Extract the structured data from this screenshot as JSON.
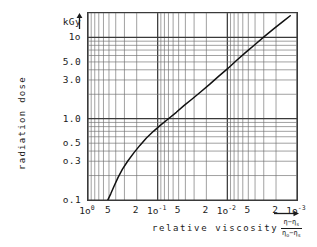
{
  "chart_data": {
    "type": "line",
    "title": "",
    "xlabel": "relative viscosity",
    "xlabel_formula": {
      "numerator": "η − η",
      "numerator_sub": "s",
      "denominator": "η",
      "denominator_sub1": "o",
      "denominator_sub2": "s"
    },
    "ylabel": "radiation dose",
    "yunit": "kGy",
    "xscale": "log",
    "yscale": "log",
    "x_direction": "decreasing",
    "xlim": [
      1.0,
      0.001
    ],
    "ylim": [
      0.1,
      20
    ],
    "grid": true,
    "legend": "none",
    "xticks": [
      {
        "value": 1.0,
        "label": "1o",
        "sup": "0"
      },
      {
        "value": 0.5,
        "label": "5",
        "sup": ""
      },
      {
        "value": 0.2,
        "label": "2",
        "sup": ""
      },
      {
        "value": 0.1,
        "label": "1o",
        "sup": "-1"
      },
      {
        "value": 0.05,
        "label": "5",
        "sup": ""
      },
      {
        "value": 0.02,
        "label": "2",
        "sup": ""
      },
      {
        "value": 0.01,
        "label": "1o",
        "sup": "-2"
      },
      {
        "value": 0.005,
        "label": "5",
        "sup": ""
      },
      {
        "value": 0.002,
        "label": "2",
        "sup": ""
      },
      {
        "value": 0.001,
        "label": "1o",
        "sup": "-3"
      }
    ],
    "yticks": [
      {
        "value": 0.1,
        "label": "o.1"
      },
      {
        "value": 0.3,
        "label": "o.3"
      },
      {
        "value": 0.5,
        "label": "o.5"
      },
      {
        "value": 1.0,
        "label": "1.0"
      },
      {
        "value": 3.0,
        "label": "3.0"
      },
      {
        "value": 5.0,
        "label": "5.0"
      },
      {
        "value": 10.0,
        "label": "1o"
      },
      {
        "value": 20.0,
        "label": "kGy"
      }
    ],
    "series": [
      {
        "name": "radiation dose vs relative viscosity",
        "points": [
          [
            0.52,
            0.1
          ],
          [
            0.47,
            0.12
          ],
          [
            0.42,
            0.15
          ],
          [
            0.37,
            0.19
          ],
          [
            0.32,
            0.24
          ],
          [
            0.27,
            0.3
          ],
          [
            0.22,
            0.38
          ],
          [
            0.18,
            0.47
          ],
          [
            0.145,
            0.58
          ],
          [
            0.115,
            0.7
          ],
          [
            0.09,
            0.84
          ],
          [
            0.07,
            1.0
          ],
          [
            0.054,
            1.2
          ],
          [
            0.042,
            1.45
          ],
          [
            0.032,
            1.75
          ],
          [
            0.024,
            2.15
          ],
          [
            0.018,
            2.65
          ],
          [
            0.0135,
            3.3
          ],
          [
            0.01,
            4.1
          ],
          [
            0.0074,
            5.2
          ],
          [
            0.0055,
            6.5
          ],
          [
            0.004,
            8.2
          ],
          [
            0.0029,
            10.4
          ],
          [
            0.0021,
            13.0
          ],
          [
            0.00155,
            16.0
          ],
          [
            0.00125,
            18.5
          ]
        ]
      }
    ]
  },
  "axes": {
    "y_unit_label": "kGy",
    "y_title": "radiation dose",
    "x_title": "relative viscosity"
  },
  "icons": {
    "y_arrow": "up-arrow-icon",
    "x_arrow": "right-arrow-icon"
  }
}
